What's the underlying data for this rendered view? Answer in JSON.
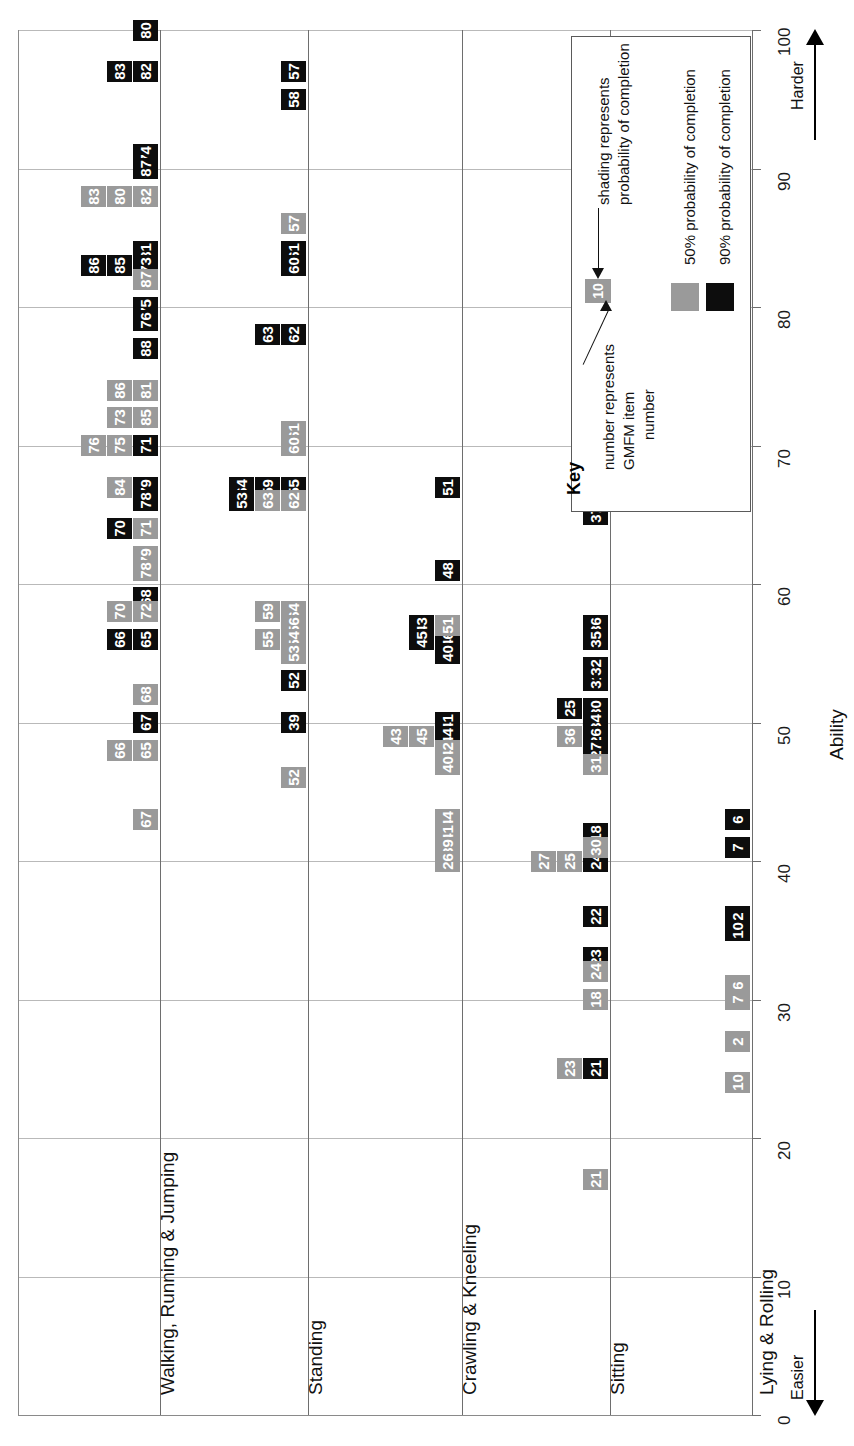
{
  "chart_data": {
    "type": "scatter",
    "title": "",
    "xlabel": "",
    "ylabel": "Ability",
    "axis_title": "Ability",
    "axis_ticks": [
      0,
      10,
      20,
      30,
      40,
      50,
      60,
      70,
      80,
      90,
      100
    ],
    "axis_range": [
      0,
      100
    ],
    "grid": true,
    "direction_labels": {
      "low": "Easier",
      "high": "Harder"
    },
    "legend_position": "top-right",
    "series": [
      {
        "name": "50% probability of completion",
        "color": "#9a9a9a"
      },
      {
        "name": "90% probability of completion",
        "color": "#0d0d0d"
      }
    ],
    "categories": [
      "Walking, Running & Jumping",
      "Standing",
      "Crawling & Kneeling",
      "Sitting",
      "Lying & Rolling"
    ],
    "points": [
      {
        "dim": "Walking, Running & Jumping",
        "item": 80,
        "ability": 100,
        "p": "90"
      },
      {
        "dim": "Walking, Running & Jumping",
        "item": 82,
        "ability": 97,
        "p": "90"
      },
      {
        "dim": "Walking, Running & Jumping",
        "item": 83,
        "ability": 97,
        "p": "90"
      },
      {
        "dim": "Walking, Running & Jumping",
        "item": 74,
        "ability": 91,
        "p": "90"
      },
      {
        "dim": "Walking, Running & Jumping",
        "item": 87,
        "ability": 90,
        "p": "90"
      },
      {
        "dim": "Walking, Running & Jumping",
        "item": 82,
        "ability": 88,
        "p": "50"
      },
      {
        "dim": "Walking, Running & Jumping",
        "item": 80,
        "ability": 88,
        "p": "50"
      },
      {
        "dim": "Walking, Running & Jumping",
        "item": 83,
        "ability": 88,
        "p": "50"
      },
      {
        "dim": "Walking, Running & Jumping",
        "item": 81,
        "ability": 84,
        "p": "90"
      },
      {
        "dim": "Walking, Running & Jumping",
        "item": 73,
        "ability": 83,
        "p": "90"
      },
      {
        "dim": "Walking, Running & Jumping",
        "item": 85,
        "ability": 83,
        "p": "90"
      },
      {
        "dim": "Walking, Running & Jumping",
        "item": 86,
        "ability": 83,
        "p": "90"
      },
      {
        "dim": "Walking, Running & Jumping",
        "item": 87,
        "ability": 82,
        "p": "50"
      },
      {
        "dim": "Walking, Running & Jumping",
        "item": 74,
        "ability": 80,
        "p": "50"
      },
      {
        "dim": "Walking, Running & Jumping",
        "item": 75,
        "ability": 80,
        "p": "90"
      },
      {
        "dim": "Walking, Running & Jumping",
        "item": 76,
        "ability": 79,
        "p": "90"
      },
      {
        "dim": "Walking, Running & Jumping",
        "item": 88,
        "ability": 77,
        "p": "90"
      },
      {
        "dim": "Walking, Running & Jumping",
        "item": 84,
        "ability": 74,
        "p": "90"
      },
      {
        "dim": "Walking, Running & Jumping",
        "item": 81,
        "ability": 74,
        "p": "50"
      },
      {
        "dim": "Walking, Running & Jumping",
        "item": 77,
        "ability": 74,
        "p": "90"
      },
      {
        "dim": "Walking, Running & Jumping",
        "item": 86,
        "ability": 74,
        "p": "50"
      },
      {
        "dim": "Walking, Running & Jumping",
        "item": 85,
        "ability": 72,
        "p": "50"
      },
      {
        "dim": "Walking, Running & Jumping",
        "item": 73,
        "ability": 72,
        "p": "50"
      },
      {
        "dim": "Walking, Running & Jumping",
        "item": 88,
        "ability": 70,
        "p": "50"
      },
      {
        "dim": "Walking, Running & Jumping",
        "item": 75,
        "ability": 70,
        "p": "50"
      },
      {
        "dim": "Walking, Running & Jumping",
        "item": 76,
        "ability": 70,
        "p": "50"
      },
      {
        "dim": "Walking, Running & Jumping",
        "item": 71,
        "ability": 70,
        "p": "90"
      },
      {
        "dim": "Walking, Running & Jumping",
        "item": 77,
        "ability": 67,
        "p": "50"
      },
      {
        "dim": "Walking, Running & Jumping",
        "item": 79,
        "ability": 67,
        "p": "90"
      },
      {
        "dim": "Walking, Running & Jumping",
        "item": 84,
        "ability": 67,
        "p": "50"
      },
      {
        "dim": "Walking, Running & Jumping",
        "item": 78,
        "ability": 66,
        "p": "90"
      },
      {
        "dim": "Walking, Running & Jumping",
        "item": 72,
        "ability": 64,
        "p": "90"
      },
      {
        "dim": "Walking, Running & Jumping",
        "item": 70,
        "ability": 64,
        "p": "90"
      },
      {
        "dim": "Walking, Running & Jumping",
        "item": 71,
        "ability": 64,
        "p": "50"
      },
      {
        "dim": "Walking, Running & Jumping",
        "item": 69,
        "ability": 62,
        "p": "90"
      },
      {
        "dim": "Walking, Running & Jumping",
        "item": 79,
        "ability": 62,
        "p": "50"
      },
      {
        "dim": "Walking, Running & Jumping",
        "item": 78,
        "ability": 61,
        "p": "50"
      },
      {
        "dim": "Walking, Running & Jumping",
        "item": 68,
        "ability": 59,
        "p": "90"
      },
      {
        "dim": "Walking, Running & Jumping",
        "item": 72,
        "ability": 58,
        "p": "50"
      },
      {
        "dim": "Walking, Running & Jumping",
        "item": 70,
        "ability": 58,
        "p": "50"
      },
      {
        "dim": "Walking, Running & Jumping",
        "item": 69,
        "ability": 56,
        "p": "50"
      },
      {
        "dim": "Walking, Running & Jumping",
        "item": 65,
        "ability": 56,
        "p": "90"
      },
      {
        "dim": "Walking, Running & Jumping",
        "item": 66,
        "ability": 56,
        "p": "90"
      },
      {
        "dim": "Walking, Running & Jumping",
        "item": 68,
        "ability": 52,
        "p": "50"
      },
      {
        "dim": "Walking, Running & Jumping",
        "item": 67,
        "ability": 50,
        "p": "90"
      },
      {
        "dim": "Walking, Running & Jumping",
        "item": 65,
        "ability": 48,
        "p": "50"
      },
      {
        "dim": "Walking, Running & Jumping",
        "item": 66,
        "ability": 48,
        "p": "50"
      },
      {
        "dim": "Walking, Running & Jumping",
        "item": 67,
        "ability": 43,
        "p": "50"
      },
      {
        "dim": "Standing",
        "item": 57,
        "ability": 97,
        "p": "90"
      },
      {
        "dim": "Standing",
        "item": 58,
        "ability": 95,
        "p": "90"
      },
      {
        "dim": "Standing",
        "item": 57,
        "ability": 86,
        "p": "50"
      },
      {
        "dim": "Standing",
        "item": 58,
        "ability": 84,
        "p": "50"
      },
      {
        "dim": "Standing",
        "item": 61,
        "ability": 84,
        "p": "90"
      },
      {
        "dim": "Standing",
        "item": 60,
        "ability": 83,
        "p": "90"
      },
      {
        "dim": "Standing",
        "item": 62,
        "ability": 78,
        "p": "90"
      },
      {
        "dim": "Standing",
        "item": 63,
        "ability": 78,
        "p": "90"
      },
      {
        "dim": "Standing",
        "item": 61,
        "ability": 71,
        "p": "50"
      },
      {
        "dim": "Standing",
        "item": 60,
        "ability": 70,
        "p": "50"
      },
      {
        "dim": "Standing",
        "item": 55,
        "ability": 67,
        "p": "90"
      },
      {
        "dim": "Standing",
        "item": 56,
        "ability": 66,
        "p": "90"
      },
      {
        "dim": "Standing",
        "item": 59,
        "ability": 67,
        "p": "90"
      },
      {
        "dim": "Standing",
        "item": 64,
        "ability": 67,
        "p": "90"
      },
      {
        "dim": "Standing",
        "item": 62,
        "ability": 66,
        "p": "50"
      },
      {
        "dim": "Standing",
        "item": 63,
        "ability": 66,
        "p": "50"
      },
      {
        "dim": "Standing",
        "item": 54,
        "ability": 66,
        "p": "90"
      },
      {
        "dim": "Standing",
        "item": 53,
        "ability": 66,
        "p": "90"
      },
      {
        "dim": "Standing",
        "item": 64,
        "ability": 58,
        "p": "50"
      },
      {
        "dim": "Standing",
        "item": 59,
        "ability": 58,
        "p": "50"
      },
      {
        "dim": "Standing",
        "item": 56,
        "ability": 57,
        "p": "50"
      },
      {
        "dim": "Standing",
        "item": 54,
        "ability": 56,
        "p": "50"
      },
      {
        "dim": "Standing",
        "item": 55,
        "ability": 56,
        "p": "50"
      },
      {
        "dim": "Standing",
        "item": 53,
        "ability": 55,
        "p": "50"
      },
      {
        "dim": "Standing",
        "item": 52,
        "ability": 53,
        "p": "90"
      },
      {
        "dim": "Standing",
        "item": 39,
        "ability": 50,
        "p": "90"
      },
      {
        "dim": "Standing",
        "item": 52,
        "ability": 46,
        "p": "50"
      },
      {
        "dim": "Crawling & Kneeling",
        "item": 51,
        "ability": 67,
        "p": "90"
      },
      {
        "dim": "Crawling & Kneeling",
        "item": 48,
        "ability": 61,
        "p": "90"
      },
      {
        "dim": "Crawling & Kneeling",
        "item": 42,
        "ability": 57,
        "p": "90"
      },
      {
        "dim": "Crawling & Kneeling",
        "item": 46,
        "ability": 56,
        "p": "90"
      },
      {
        "dim": "Crawling & Kneeling",
        "item": 45,
        "ability": 56,
        "p": "90"
      },
      {
        "dim": "Crawling & Kneeling",
        "item": 51,
        "ability": 57,
        "p": "50"
      },
      {
        "dim": "Crawling & Kneeling",
        "item": 43,
        "ability": 57,
        "p": "90"
      },
      {
        "dim": "Crawling & Kneeling",
        "item": 40,
        "ability": 55,
        "p": "90"
      },
      {
        "dim": "Crawling & Kneeling",
        "item": 48,
        "ability": 50,
        "p": "50"
      },
      {
        "dim": "Crawling & Kneeling",
        "item": 41,
        "ability": 50,
        "p": "90"
      },
      {
        "dim": "Crawling & Kneeling",
        "item": 46,
        "ability": 49,
        "p": "50"
      },
      {
        "dim": "Crawling & Kneeling",
        "item": 44,
        "ability": 49,
        "p": "90"
      },
      {
        "dim": "Crawling & Kneeling",
        "item": 45,
        "ability": 49,
        "p": "50"
      },
      {
        "dim": "Crawling & Kneeling",
        "item": 43,
        "ability": 49,
        "p": "50"
      },
      {
        "dim": "Crawling & Kneeling",
        "item": 42,
        "ability": 48,
        "p": "50"
      },
      {
        "dim": "Crawling & Kneeling",
        "item": 40,
        "ability": 47,
        "p": "50"
      },
      {
        "dim": "Crawling & Kneeling",
        "item": 44,
        "ability": 43,
        "p": "50"
      },
      {
        "dim": "Crawling & Kneeling",
        "item": 41,
        "ability": 42,
        "p": "50"
      },
      {
        "dim": "Crawling & Kneeling",
        "item": 39,
        "ability": 41,
        "p": "50"
      },
      {
        "dim": "Crawling & Kneeling",
        "item": 26,
        "ability": 40,
        "p": "50"
      },
      {
        "dim": "Sitting",
        "item": 51,
        "ability": 67,
        "p": "90"
      },
      {
        "dim": "Sitting",
        "item": 37,
        "ability": 65,
        "p": "90"
      },
      {
        "dim": "Sitting",
        "item": 36,
        "ability": 57,
        "p": "90"
      },
      {
        "dim": "Sitting",
        "item": 35,
        "ability": 56,
        "p": "90"
      },
      {
        "dim": "Sitting",
        "item": 37,
        "ability": 53,
        "p": "50"
      },
      {
        "dim": "Sitting",
        "item": 31,
        "ability": 53,
        "p": "90"
      },
      {
        "dim": "Sitting",
        "item": 32,
        "ability": 54,
        "p": "90"
      },
      {
        "dim": "Sitting",
        "item": 30,
        "ability": 51,
        "p": "90"
      },
      {
        "dim": "Sitting",
        "item": 25,
        "ability": 51,
        "p": "90"
      },
      {
        "dim": "Sitting",
        "item": 34,
        "ability": 50,
        "p": "90"
      },
      {
        "dim": "Sitting",
        "item": 35,
        "ability": 49,
        "p": "50"
      },
      {
        "dim": "Sitting",
        "item": 26,
        "ability": 49,
        "p": "90"
      },
      {
        "dim": "Sitting",
        "item": 36,
        "ability": 49,
        "p": "50"
      },
      {
        "dim": "Sitting",
        "item": 32,
        "ability": 48,
        "p": "50"
      },
      {
        "dim": "Sitting",
        "item": 27,
        "ability": 48,
        "p": "90"
      },
      {
        "dim": "Sitting",
        "item": 31,
        "ability": 47,
        "p": "50"
      },
      {
        "dim": "Sitting",
        "item": 18,
        "ability": 42,
        "p": "90"
      },
      {
        "dim": "Sitting",
        "item": 34,
        "ability": 40,
        "p": "50"
      },
      {
        "dim": "Sitting",
        "item": 24,
        "ability": 40,
        "p": "90"
      },
      {
        "dim": "Sitting",
        "item": 25,
        "ability": 40,
        "p": "50"
      },
      {
        "dim": "Sitting",
        "item": 30,
        "ability": 41,
        "p": "50"
      },
      {
        "dim": "Sitting",
        "item": 27,
        "ability": 40,
        "p": "50"
      },
      {
        "dim": "Sitting",
        "item": 22,
        "ability": 36,
        "p": "90"
      },
      {
        "dim": "Sitting",
        "item": 23,
        "ability": 33,
        "p": "90"
      },
      {
        "dim": "Sitting",
        "item": 24,
        "ability": 32,
        "p": "50"
      },
      {
        "dim": "Sitting",
        "item": 18,
        "ability": 30,
        "p": "50"
      },
      {
        "dim": "Sitting",
        "item": 22,
        "ability": 25,
        "p": "50"
      },
      {
        "dim": "Sitting",
        "item": 23,
        "ability": 25,
        "p": "50"
      },
      {
        "dim": "Sitting",
        "item": 21,
        "ability": 25,
        "p": "90"
      },
      {
        "dim": "Sitting",
        "item": 21,
        "ability": 17,
        "p": "50"
      },
      {
        "dim": "Lying & Rolling",
        "item": 6,
        "ability": 43,
        "p": "90"
      },
      {
        "dim": "Lying & Rolling",
        "item": 7,
        "ability": 41,
        "p": "90"
      },
      {
        "dim": "Lying & Rolling",
        "item": 2,
        "ability": 36,
        "p": "90"
      },
      {
        "dim": "Lying & Rolling",
        "item": 10,
        "ability": 35,
        "p": "90"
      },
      {
        "dim": "Lying & Rolling",
        "item": 6,
        "ability": 31,
        "p": "50"
      },
      {
        "dim": "Lying & Rolling",
        "item": 7,
        "ability": 30,
        "p": "50"
      },
      {
        "dim": "Lying & Rolling",
        "item": 2,
        "ability": 27,
        "p": "50"
      },
      {
        "dim": "Lying & Rolling",
        "item": 10,
        "ability": 24,
        "p": "50"
      }
    ]
  },
  "axis": {
    "title": "Ability",
    "ticks": [
      "0",
      "10",
      "20",
      "30",
      "40",
      "50",
      "60",
      "70",
      "80",
      "90",
      "100"
    ],
    "easier": "Easier",
    "harder": "Harder"
  },
  "rows": {
    "walking": "Walking, Running & Jumping",
    "standing": "Standing",
    "crawling": "Crawling & Kneeling",
    "sitting": "Sitting",
    "lying": "Lying & Rolling"
  },
  "key": {
    "title": "Key",
    "sample_number": "10",
    "note_shading_l1": "shading represents",
    "note_shading_l2": "probability of completion",
    "note_number_l1": "number represents",
    "note_number_l2": "GMFM item",
    "note_number_l3": "number",
    "legend_50": "50% probability of completion",
    "legend_90": "90% probability of completion",
    "swatch_50_number": "50",
    "color_50": "#9a9a9a",
    "color_90": "#0d0d0d"
  }
}
